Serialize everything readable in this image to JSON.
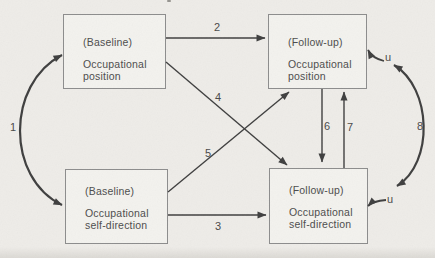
{
  "figure": {
    "type": "path-diagram",
    "colors": {
      "bg": "#eeece8",
      "line": "#3e3e3e",
      "text": "#4c4c4c",
      "box-border": "#8c8c8c",
      "box-fill": "#f3f2ee"
    }
  },
  "boxes": {
    "baseline_position": {
      "tag": "(Baseline)",
      "label": "Occupational position"
    },
    "followup_position": {
      "tag": "(Follow-up)",
      "label": "Occupational position"
    },
    "baseline_selfdirection": {
      "tag": "(Baseline)",
      "label": "Occupational self-direction"
    },
    "followup_selfdirection": {
      "tag": "(Follow-up)",
      "label": "Occupational self-direction"
    }
  },
  "path_labels": {
    "p1": "1",
    "p2": "2",
    "p3": "3",
    "p4": "4",
    "p5": "5",
    "p6": "6",
    "p7": "7",
    "p8": "8"
  },
  "disturbances": {
    "top": "u",
    "bottom": "u"
  }
}
